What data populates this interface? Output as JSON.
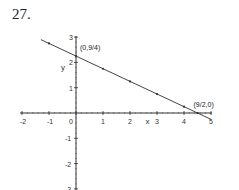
{
  "problem_number": "27.",
  "chart_data": {
    "type": "line",
    "title": "",
    "xlabel": "x",
    "ylabel": "y",
    "xlim": [
      -2,
      5
    ],
    "ylim": [
      -3,
      3
    ],
    "x_ticks": [
      "-2",
      "-1",
      "0",
      "1",
      "2",
      "3",
      "4",
      "5"
    ],
    "y_ticks": [
      "3",
      "2",
      "1",
      "0",
      "-1",
      "-2",
      "-3"
    ],
    "grid": false,
    "series": [
      {
        "name": "y = -x/2 + 9/4",
        "x": [
          -1.3,
          0,
          1,
          2,
          3,
          4,
          4.5,
          5
        ],
        "values": [
          2.9,
          2.25,
          1.75,
          1.25,
          0.75,
          0.25,
          0,
          -0.25
        ]
      }
    ],
    "annotations": [
      {
        "text": "(0,9/4)",
        "x": 0,
        "y": 2.25
      },
      {
        "text": "(9/2,0)",
        "x": 4.5,
        "y": 0
      }
    ]
  }
}
